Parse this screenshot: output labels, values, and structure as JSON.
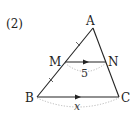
{
  "problem_number": "(2)",
  "points": {
    "A": {
      "label": "A"
    },
    "M": {
      "label": "M"
    },
    "N": {
      "label": "N"
    },
    "B": {
      "label": "B"
    },
    "C": {
      "label": "C"
    }
  },
  "segments": {
    "MN": {
      "length_label": "5"
    },
    "BC": {
      "length_label": "x"
    }
  },
  "colors": {
    "line": "#222222",
    "dotted_arc": "#b0b0b0"
  }
}
